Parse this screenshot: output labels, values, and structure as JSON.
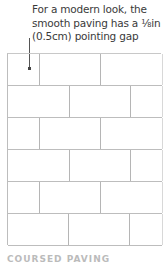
{
  "caption": {
    "line1": "For a modern look, the",
    "line2": "smooth paving has a ⅛in",
    "line3": "(0.5cm) pointing gap"
  },
  "diagram": {
    "type": "running-bond paving grid",
    "rows": 6,
    "line_color": "#bdbdbd"
  },
  "footer": {
    "label": "COURSED PAVING"
  }
}
